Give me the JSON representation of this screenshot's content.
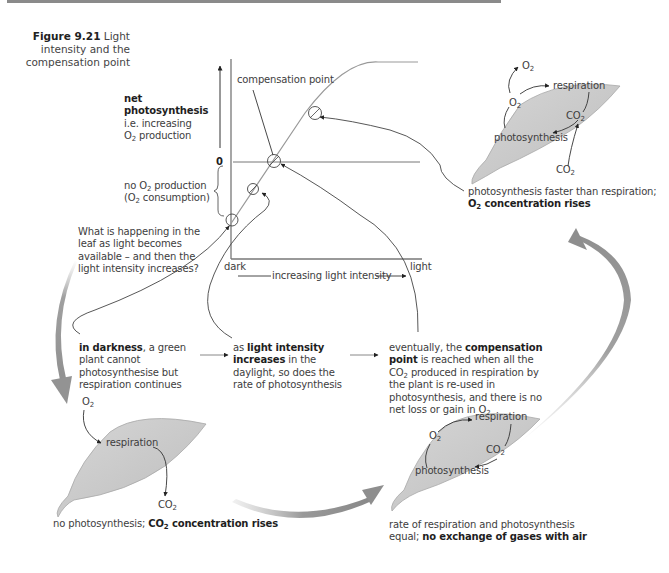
{
  "figure": {
    "number_label": "Figure 9.21",
    "title": "Light intensity and the compensation point"
  },
  "graph": {
    "y_label_bold": "net photosynthesis",
    "y_label_line2": "i.e. increasing",
    "y_label_line3_pre": "O",
    "y_label_line3_sub": "2",
    "y_label_line3_post": " production",
    "zero_label": "0",
    "below_zero_line1_pre": "no O",
    "below_zero_line1_sub": "2",
    "below_zero_line1_post": " production",
    "below_zero_line2_pre": "(O",
    "below_zero_line2_sub": "2",
    "below_zero_line2_post": " consumption)",
    "compensation_point_label": "compensation point",
    "x_left_label": "dark",
    "x_right_label": "light",
    "x_axis_label": "increasing light intensity"
  },
  "question": {
    "text": "What is happening in the leaf as light becomes available – and then the light intensity increases?"
  },
  "stages": {
    "darkness": {
      "bold": "in darkness",
      "rest": ", a green plant cannot photosynthesise but respiration continues"
    },
    "increasing": {
      "pre": "as ",
      "bold": "light intensity increases",
      "rest": " in the daylight, so does the rate of photosynthesis"
    },
    "compensation": {
      "pre": "eventually, the ",
      "bold": "compensation point",
      "line2_pre": " is reached when all the CO",
      "line2_sub": "2",
      "line2_post": " produced in respiration by the plant is re-used in photosynthesis, and there is no net loss or gain in O",
      "line_end_sub": "2"
    }
  },
  "leaves": {
    "dark_leaf": {
      "o2": "O",
      "o2_sub": "2",
      "process": "respiration",
      "co2": "CO",
      "co2_sub": "2",
      "caption_normal": "no photosynthesis; ",
      "caption_bold_pre": "CO",
      "caption_bold_sub": "2",
      "caption_bold_post": " concentration rises"
    },
    "equal_leaf": {
      "respiration": "respiration",
      "photosynthesis": "photosynthesis",
      "o2": "O",
      "o2_sub": "2",
      "co2": "CO",
      "co2_sub": "2",
      "caption_line1": "rate of respiration and photosynthesis",
      "caption_line2_normal": "equal; ",
      "caption_line2_bold": "no exchange of gases with air"
    },
    "light_leaf": {
      "respiration": "respiration",
      "photosynthesis": "photosynthesis",
      "o2_out": "O",
      "o2_out_sub": "2",
      "o2": "O",
      "o2_sub": "2",
      "co2": "CO",
      "co2_sub": "2",
      "co2_in": "CO",
      "co2_in_sub": "2",
      "caption_line1": "photosynthesis faster than respiration;",
      "caption_bold_pre": "O",
      "caption_bold_sub": "2",
      "caption_bold_post": " concentration rises"
    }
  },
  "colors": {
    "leaf_fill": "#c8c8c8",
    "leaf_stroke": "#9a9a9a",
    "cycle_arrow": "#999999",
    "line": "#555555",
    "curve": "#9a9a9a"
  }
}
